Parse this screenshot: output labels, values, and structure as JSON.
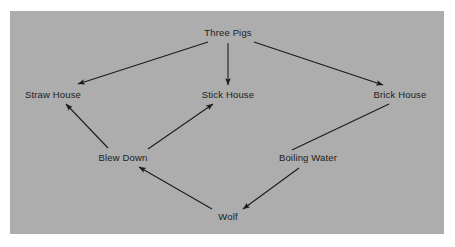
{
  "diagram": {
    "type": "directed-graph",
    "panel": {
      "background_color": "#adadad",
      "outer_background_color": "#ffffff"
    },
    "edge_color": "#1c1c1c",
    "text_color": "#1c1c1c",
    "nodes": [
      {
        "id": "three-pigs",
        "label": "Three Pigs",
        "x": 228,
        "y": 33
      },
      {
        "id": "straw-house",
        "label": "Straw House",
        "x": 53,
        "y": 95
      },
      {
        "id": "stick-house",
        "label": "Stick House",
        "x": 228,
        "y": 95
      },
      {
        "id": "brick-house",
        "label": "Brick House",
        "x": 400,
        "y": 95
      },
      {
        "id": "blew-down",
        "label": "Blew Down",
        "x": 123,
        "y": 158
      },
      {
        "id": "boiling-water",
        "label": "Boiling Water",
        "x": 308,
        "y": 158
      },
      {
        "id": "wolf",
        "label": "Wolf",
        "x": 228,
        "y": 217
      }
    ],
    "edges": [
      {
        "id": "three-pigs-to-straw-house",
        "from": "Three Pigs",
        "to": "Straw House",
        "x1": 208,
        "y1": 42,
        "x2": 78,
        "y2": 84,
        "arrowhead": true
      },
      {
        "id": "three-pigs-to-stick-house",
        "from": "Three Pigs",
        "to": "Stick House",
        "x1": 228,
        "y1": 43,
        "x2": 228,
        "y2": 85,
        "arrowhead": true
      },
      {
        "id": "three-pigs-to-brick-house",
        "from": "Three Pigs",
        "to": "Brick House",
        "x1": 254,
        "y1": 42,
        "x2": 383,
        "y2": 85,
        "arrowhead": true
      },
      {
        "id": "blew-down-to-straw-house",
        "from": "Blew Down",
        "to": "Straw House",
        "x1": 108,
        "y1": 148,
        "x2": 66,
        "y2": 104,
        "arrowhead": true
      },
      {
        "id": "blew-down-to-stick-house",
        "from": "Blew Down",
        "to": "Stick House",
        "x1": 148,
        "y1": 149,
        "x2": 213,
        "y2": 104,
        "arrowhead": true
      },
      {
        "id": "boiling-water-to-brick-house",
        "from": "Boiling Water",
        "to": "Brick House",
        "x1": 292,
        "y1": 150,
        "x2": 389,
        "y2": 104,
        "arrowhead": false
      },
      {
        "id": "wolf-to-blew-down",
        "from": "Wolf",
        "to": "Blew Down",
        "x1": 212,
        "y1": 209,
        "x2": 139,
        "y2": 167,
        "arrowhead": true
      },
      {
        "id": "boiling-water-to-wolf",
        "from": "Boiling Water",
        "to": "Wolf",
        "x1": 299,
        "y1": 168,
        "x2": 243,
        "y2": 209,
        "arrowhead": true
      }
    ]
  }
}
